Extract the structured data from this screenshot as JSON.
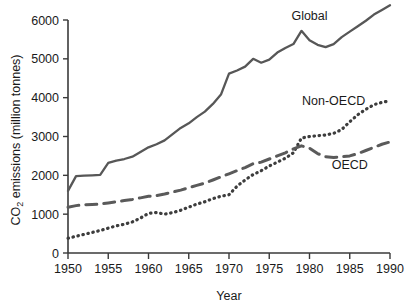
{
  "chart_data": {
    "type": "line",
    "title": "",
    "xlabel": "Year",
    "ylabel": "CO2 emissions (million tonnes)",
    "ylabel_parts": {
      "pre": "CO",
      "sub": "2",
      "post": " emissions (million tonnes)"
    },
    "xlim": [
      1950,
      1990
    ],
    "ylim": [
      0,
      6000
    ],
    "grid": false,
    "legend_position": "inline-annotations",
    "xticks": [
      1950,
      1955,
      1960,
      1965,
      1970,
      1975,
      1980,
      1985,
      1990
    ],
    "xtick_labels": [
      "1950",
      "1955",
      "1960",
      "1965",
      "1970",
      "1975",
      "1980",
      "1985",
      "1990"
    ],
    "yticks": [
      0,
      1000,
      2000,
      3000,
      4000,
      5000,
      6000
    ],
    "ytick_labels": [
      "0",
      "1000",
      "2000",
      "3000",
      "4000",
      "5000",
      "6000"
    ],
    "x": [
      1950,
      1951,
      1952,
      1953,
      1954,
      1955,
      1956,
      1957,
      1958,
      1959,
      1960,
      1961,
      1962,
      1963,
      1964,
      1965,
      1966,
      1967,
      1968,
      1969,
      1970,
      1971,
      1972,
      1973,
      1974,
      1975,
      1976,
      1977,
      1978,
      1979,
      1980,
      1981,
      1982,
      1983,
      1984,
      1985,
      1986,
      1987,
      1988,
      1989,
      1990
    ],
    "series": [
      {
        "name": "Global",
        "style": "solid",
        "color": "#575757",
        "label": "Global",
        "values": [
          1600,
          1980,
          1990,
          2000,
          2010,
          2320,
          2380,
          2420,
          2480,
          2600,
          2720,
          2800,
          2900,
          3060,
          3220,
          3340,
          3500,
          3640,
          3840,
          4080,
          4620,
          4700,
          4800,
          5000,
          4900,
          4980,
          5160,
          5280,
          5380,
          5720,
          5480,
          5360,
          5300,
          5380,
          5560,
          5700,
          5840,
          5980,
          6140,
          6260,
          6380
        ]
      },
      {
        "name": "Non-OECD",
        "style": "dotted",
        "color": "#3d3d3d",
        "label": "Non-OECD",
        "values": [
          380,
          430,
          480,
          530,
          580,
          640,
          700,
          740,
          800,
          900,
          1020,
          1040,
          1000,
          1040,
          1100,
          1180,
          1260,
          1320,
          1400,
          1460,
          1500,
          1720,
          1880,
          2020,
          2120,
          2240,
          2340,
          2440,
          2580,
          2960,
          3000,
          3020,
          3040,
          3080,
          3180,
          3380,
          3560,
          3700,
          3820,
          3880,
          3920
        ]
      },
      {
        "name": "OECD",
        "style": "dashed",
        "color": "#5a5a5a",
        "label": "OECD",
        "values": [
          1180,
          1220,
          1240,
          1250,
          1260,
          1290,
          1320,
          1350,
          1380,
          1420,
          1460,
          1480,
          1520,
          1570,
          1620,
          1680,
          1740,
          1800,
          1880,
          1960,
          2040,
          2120,
          2200,
          2300,
          2340,
          2420,
          2500,
          2580,
          2680,
          2760,
          2700,
          2560,
          2480,
          2460,
          2480,
          2500,
          2560,
          2640,
          2720,
          2800,
          2860
        ]
      }
    ],
    "annotations": [
      {
        "text": "Global",
        "x": 1980,
        "y": 6000,
        "name": "global-series-label"
      },
      {
        "text": "Non-OECD",
        "x": 1983,
        "y": 3820,
        "name": "non-oecd-series-label"
      },
      {
        "text": "OECD",
        "x": 1985,
        "y": 2160,
        "name": "oecd-series-label"
      }
    ]
  }
}
